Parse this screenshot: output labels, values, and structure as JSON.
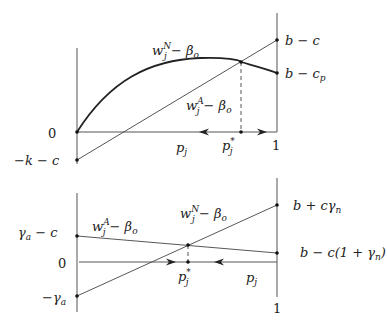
{
  "top_panel": {
    "curve_label": {
      "base": "w",
      "sup": "N",
      "sub": "j",
      "rest": " − β",
      "rest_sub": "o"
    },
    "line_label": {
      "base": "w",
      "sup": "A",
      "sub": "j",
      "rest": " − β",
      "rest_sub": "o"
    },
    "left_labels": {
      "zero": "0",
      "bottom": "−k − c"
    },
    "right_labels": {
      "top": "b − c",
      "bottom_base": "b − c",
      "bottom_sub": "p"
    },
    "x_labels": {
      "p": "p",
      "p_sub": "j",
      "pstar": "p",
      "pstar_sup": "*",
      "pstar_sub": "j",
      "one": "1"
    }
  },
  "bottom_panel": {
    "line_A_label": {
      "base": "w",
      "sup": "A",
      "sub": "j",
      "rest": " − β",
      "rest_sub": "o"
    },
    "line_N_label": {
      "base": "w",
      "sup": "N",
      "sub": "j",
      "rest": " − β",
      "rest_sub": "o"
    },
    "left_labels": {
      "top_base": "γ",
      "top_sub": "a",
      "top_rest": " − c",
      "zero": "0",
      "bottom_base": "−γ",
      "bottom_sub": "a"
    },
    "right_labels": {
      "top_base": "b + cγ",
      "top_sub": "n",
      "bottom_base": "b − c(1 + γ",
      "bottom_sub": "n",
      "bottom_end": ")"
    },
    "x_labels": {
      "p": "p",
      "p_sub": "j",
      "pstar": "p",
      "pstar_sup": "*",
      "pstar_sub": "j",
      "one": "1"
    }
  }
}
